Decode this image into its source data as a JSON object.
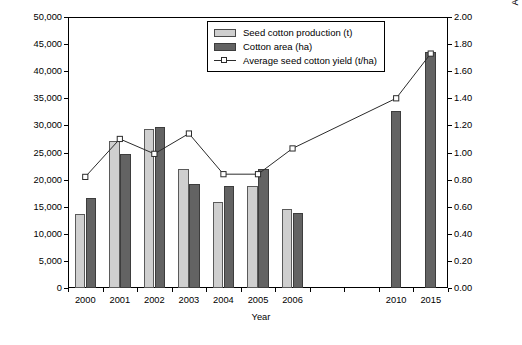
{
  "chart_data": {
    "type": "bar",
    "title": "",
    "xlabel": "Year",
    "ylabel": "Seed cotton production (t/year)\ncotton production area (ha)",
    "ylabel_right": "Average seed cotton yield (t/ha)",
    "categories": [
      "2000",
      "2001",
      "2002",
      "2003",
      "2004",
      "2005",
      "2006",
      "",
      "",
      "2010",
      "2015"
    ],
    "series": [
      {
        "name": "Seed cotton production (t)",
        "type": "bar",
        "color": "#cfcfcf",
        "axis": "left",
        "values": [
          13700,
          27200,
          29400,
          22000,
          15900,
          18800,
          14500,
          null,
          null,
          null,
          null
        ]
      },
      {
        "name": "Cotton area (ha)",
        "type": "bar",
        "color": "#636363",
        "axis": "left",
        "values": [
          16700,
          24800,
          29700,
          19200,
          18800,
          21900,
          13900,
          null,
          null,
          32700,
          43500
        ]
      },
      {
        "name": "Average seed cotton yield (t/ha)",
        "type": "line",
        "color": "#2b2b2b",
        "marker": "open-square",
        "axis": "right",
        "values": [
          0.82,
          1.1,
          0.99,
          1.14,
          0.84,
          0.84,
          1.03,
          null,
          null,
          1.4,
          1.73
        ]
      }
    ],
    "ylim": [
      0,
      50000
    ],
    "yticks": [
      "0",
      "5,000",
      "10,000",
      "15,000",
      "20,000",
      "25,000",
      "30,000",
      "35,000",
      "40,000",
      "45,000",
      "50,000"
    ],
    "ylim_right": [
      0,
      2.0
    ],
    "yticks_right": [
      "0.00",
      "0.20",
      "0.40",
      "0.60",
      "0.80",
      "1.00",
      "1.20",
      "1.40",
      "1.60",
      "1.80",
      "2.00"
    ],
    "grid": false,
    "legend_position": "top-center"
  },
  "legend": {
    "items": [
      {
        "label": "Seed cotton production (t)",
        "swatch": "prod"
      },
      {
        "label": "Cotton area (ha)",
        "swatch": "area"
      },
      {
        "label": "Average seed cotton yield (t/ha)",
        "swatch": "line"
      }
    ]
  },
  "caption": {
    "text": ""
  }
}
